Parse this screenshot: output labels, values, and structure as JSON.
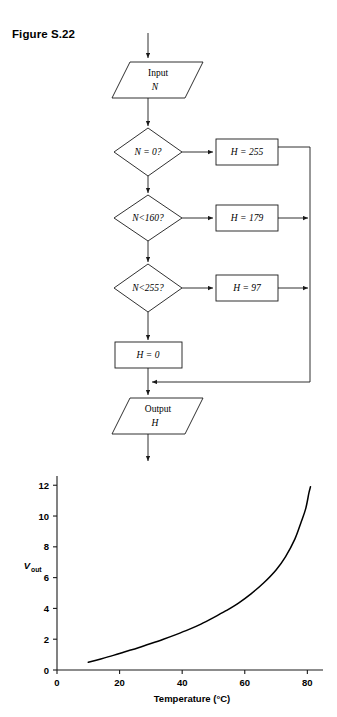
{
  "page": {
    "figure_label": "Figure S.22",
    "cropped_header_text": "",
    "cropped_footer_text": ""
  },
  "flowchart": {
    "nodes": [
      {
        "id": "input",
        "kind": "parallelogram",
        "line1": "Input",
        "line2": "N"
      },
      {
        "id": "dec1",
        "kind": "diamond",
        "line1": "N = 0?"
      },
      {
        "id": "dec2",
        "kind": "diamond",
        "line1": "N<160?"
      },
      {
        "id": "dec3",
        "kind": "diamond",
        "line1": "N<255?"
      },
      {
        "id": "proc1",
        "kind": "rectangle",
        "line1": "H = 255"
      },
      {
        "id": "proc2",
        "kind": "rectangle",
        "line1": "H = 179"
      },
      {
        "id": "proc3",
        "kind": "rectangle",
        "line1": "H = 97"
      },
      {
        "id": "proc4",
        "kind": "rectangle",
        "line1": "H = 0"
      },
      {
        "id": "output",
        "kind": "parallelogram",
        "line1": "Output",
        "line2": "H"
      }
    ],
    "labels": {
      "input_line1": "Input",
      "input_line2": "N",
      "dec1": "N = 0?",
      "dec2": "N<160?",
      "dec3": "N<255?",
      "proc1": "H = 255",
      "proc2": "H = 179",
      "proc3": "H = 97",
      "proc4": "H = 0",
      "output_line1": "Output",
      "output_line2": "H"
    },
    "stroke_color": "#1a1a1a"
  },
  "chart_data": {
    "type": "line",
    "title": "",
    "xlabel": "Temperature (°C)",
    "ylabel": "V",
    "ylabel_sub": "out",
    "xlim": [
      0,
      85
    ],
    "ylim": [
      0,
      12.6
    ],
    "xticks": [
      0,
      20,
      40,
      60,
      80
    ],
    "yticks": [
      0,
      2,
      4,
      6,
      8,
      10,
      12
    ],
    "xtick_labels": [
      "0",
      "20",
      "40",
      "60",
      "80"
    ],
    "ytick_labels": [
      "0",
      "2",
      "4",
      "6",
      "8",
      "10",
      "12"
    ],
    "grid": false,
    "legend": null,
    "line_color": "#000000",
    "series": [
      {
        "name": "Vout vs Temperature",
        "x": [
          10,
          14,
          18,
          22,
          26,
          30,
          34,
          38,
          42,
          46,
          50,
          54,
          58,
          62,
          66,
          70,
          73,
          76,
          78,
          79.5,
          80.5,
          81
        ],
        "y": [
          0.5,
          0.72,
          0.95,
          1.2,
          1.45,
          1.72,
          2.0,
          2.3,
          2.62,
          2.98,
          3.4,
          3.85,
          4.35,
          4.95,
          5.65,
          6.5,
          7.35,
          8.5,
          9.6,
          10.5,
          11.5,
          11.9
        ]
      }
    ]
  }
}
